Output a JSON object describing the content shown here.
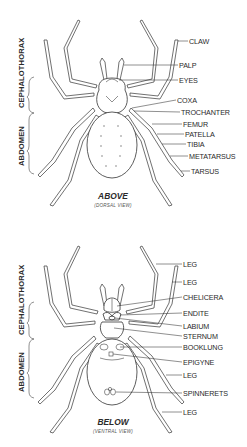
{
  "top_view": {
    "caption": "ABOVE",
    "subcaption": "(DORSAL VIEW)",
    "region_labels": [
      "CEPHALOTHORAX",
      "ABDOMEN"
    ],
    "labels": [
      "CLAW",
      "PALP",
      "EYES",
      "COXA",
      "TROCHANTER",
      "FEMUR",
      "PATELLA",
      "TIBIA",
      "METATARSUS",
      "TARSUS"
    ]
  },
  "bottom_view": {
    "caption": "BELOW",
    "subcaption": "(VENTRAL VIEW)",
    "region_labels": [
      "CEPHALOTHORAX",
      "ABDOMEN"
    ],
    "labels": [
      "LEG",
      "LEG",
      "CHELICERA",
      "ENDITE",
      "LABIUM",
      "STERNUM",
      "BOOKLUNG",
      "EPIGYNE",
      "LEG",
      "SPINNERETS",
      "LEG"
    ]
  },
  "colors": {
    "line": "#333333",
    "text": "#2a2a2a",
    "background": "#ffffff"
  }
}
